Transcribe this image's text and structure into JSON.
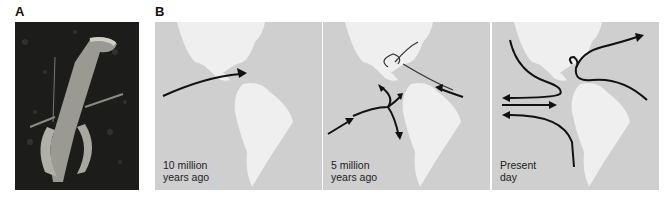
{
  "figure": {
    "panel_a": {
      "label": "A",
      "image_description": "photograph of a crustacean (snapping shrimp) on dark substrate"
    },
    "panel_b": {
      "label": "B",
      "maps": [
        {
          "caption_line1": "10 million",
          "caption_line2": "years ago"
        },
        {
          "caption_line1": "5 million",
          "caption_line2": "years ago"
        },
        {
          "caption_line1": "Present",
          "caption_line2": "day"
        }
      ]
    },
    "colors": {
      "ocean": "#cfcfcf",
      "land": "#efefef",
      "arrows": "#111111",
      "photo_bg": "#1c1c1a"
    }
  }
}
